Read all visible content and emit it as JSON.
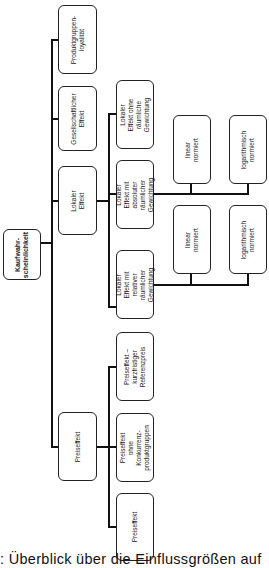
{
  "diagram": {
    "root": "Kaufwahr-\nscheinlichkeit",
    "level1": {
      "produktgruppenloyalitaet": "Produktgruppen-\nloyalität",
      "gesellschaftlicher_effekt": "Gesellschaftlicher\nEffekt",
      "lokaler_effekt": "Lokaler Effekt",
      "preiseffekt": "Preiseffekt"
    },
    "lokal_children": {
      "ohne_gewichtung": "Lokaler Effekt ohne\nräumliche\nGewichtung",
      "absolute_gewichtung": "Lokaler Effekt mit\nabsoluter\nräumlicher\nGewichtung",
      "relative_gewichtung": "Lokaler Effekt mit\nrelativer räumlicher\nGewichtung"
    },
    "absolute_children": {
      "linear": "linear normiert",
      "log": "logarithmisch\nnormiert"
    },
    "relative_children": {
      "linear": "linear normiert",
      "log": "logarithmisch\nnormiert"
    },
    "preis_children": {
      "referenzpreis": "Preiseffekt –\nkurzfristiger\nReferenzpreis",
      "ohne_konkurrenz": "Preiseffekt ohne\nKonkurrenz-\nproduktgruppen",
      "preiseffekt": "Preiseffekt"
    }
  },
  "caption": ": Überblick über die Einflussgrößen auf"
}
